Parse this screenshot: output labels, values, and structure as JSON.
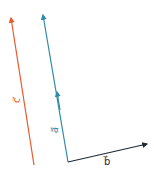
{
  "diagram": {
    "title": "",
    "vectors": [
      {
        "id": "c",
        "label": "c⃗",
        "color": "#e8592b",
        "x1": 34,
        "y1": 165,
        "x2": 11,
        "y2": 18,
        "label_x": 17,
        "label_y": 102
      },
      {
        "id": "a",
        "label": "a⃗",
        "color": "#2e8aa8",
        "x1": 68,
        "y1": 162,
        "x2": 43,
        "y2": 15,
        "mid_arrow_x": 57,
        "mid_arrow_y": 92,
        "label_x": 54,
        "label_y": 132
      },
      {
        "id": "b",
        "label": "b⃗",
        "color": "#1e2a33",
        "x1": 68,
        "y1": 162,
        "x2": 147,
        "y2": 144,
        "label_x": 106,
        "label_y": 164
      }
    ]
  }
}
